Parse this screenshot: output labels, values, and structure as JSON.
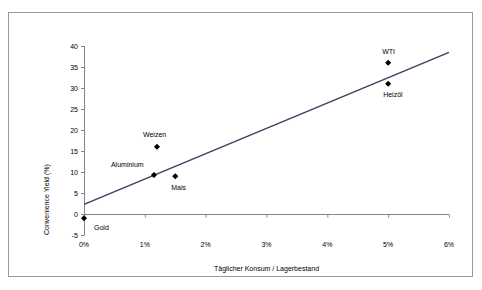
{
  "chart_data": {
    "type": "scatter",
    "title": "",
    "xlabel": "Täglicher Konsum / Lagerbestand",
    "ylabel": "Convenience Yield (%)",
    "xlim": [
      0,
      6
    ],
    "ylim": [
      -5,
      40
    ],
    "xticks": [
      "0%",
      "1%",
      "2%",
      "3%",
      "4%",
      "5%",
      "6%"
    ],
    "xtick_values": [
      0,
      1,
      2,
      3,
      4,
      5,
      6
    ],
    "yticks": [
      "-5",
      "0",
      "5",
      "10",
      "15",
      "20",
      "25",
      "30",
      "35",
      "40"
    ],
    "ytick_values": [
      -5,
      0,
      5,
      10,
      15,
      20,
      25,
      30,
      35,
      40
    ],
    "grid": false,
    "legend": "none",
    "marker_color": "#000000",
    "trendline_color": "#3f3f5f",
    "axis_color": "#868686",
    "points": [
      {
        "label": "Gold",
        "x": 0.0,
        "y": -1.0,
        "label_dx": 10,
        "label_dy": 10
      },
      {
        "label": "Aluminium",
        "x": 1.15,
        "y": 9.3,
        "label_dx": -43,
        "label_dy": -10
      },
      {
        "label": "Weizen",
        "x": 1.2,
        "y": 16.0,
        "label_dx": -14,
        "label_dy": -12
      },
      {
        "label": "Mais",
        "x": 1.5,
        "y": 9.0,
        "label_dx": -4,
        "label_dy": 12
      },
      {
        "label": "Heizöl",
        "x": 5.0,
        "y": 31.0,
        "label_dx": -5,
        "label_dy": 11
      },
      {
        "label": "WTI",
        "x": 5.0,
        "y": 36.0,
        "label_dx": -6,
        "label_dy": -11
      }
    ],
    "trendline": {
      "x0": 0.0,
      "y0": 2.3,
      "x1": 6.0,
      "y1": 38.5
    }
  }
}
